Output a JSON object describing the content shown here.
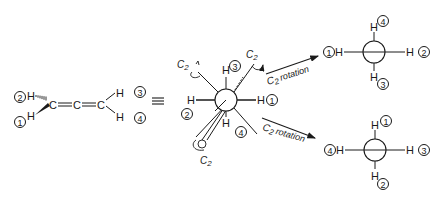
{
  "allene": {
    "atoms": {
      "c1": "C",
      "c2": "C",
      "c3": "C"
    },
    "h_left_top": "H",
    "h_left_bottom": "H",
    "h_right_top": "H",
    "h_right_bottom": "H",
    "labels": {
      "left_top": "2",
      "left_bottom": "1",
      "right_top": "3",
      "right_bottom": "4"
    }
  },
  "equivalence_symbol": "≡",
  "newman_central": {
    "h_top": "H",
    "h_left": "H",
    "h_right": "H",
    "h_bottom": "H",
    "labels": {
      "top": "3",
      "left": "2",
      "right": "1",
      "bottom": "4"
    },
    "c2_axes": [
      "C2",
      "C2",
      "C2"
    ],
    "c2_prefix": "C",
    "c2_sub": "2"
  },
  "arrows": {
    "upper": {
      "prefix": "C",
      "sub": "2",
      "text": "rotation"
    },
    "lower": {
      "prefix": "C",
      "sub": "2",
      "text": "rotation"
    }
  },
  "newman_upper": {
    "h_top": "H",
    "h_left": "H",
    "h_right": "H",
    "h_bottom": "H",
    "labels": {
      "top": "4",
      "left": "1",
      "right": "2",
      "bottom": "3"
    }
  },
  "newman_lower": {
    "h_top": "H",
    "h_left": "H",
    "h_right": "H",
    "h_bottom": "H",
    "labels": {
      "top": "1",
      "left": "4",
      "right": "3",
      "bottom": "2"
    }
  }
}
